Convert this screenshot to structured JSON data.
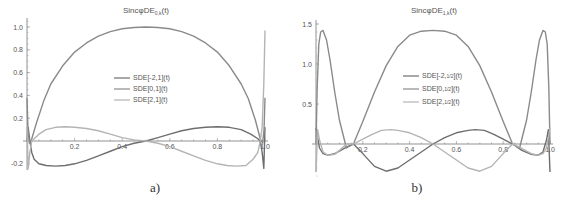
{
  "chart_data": [
    {
      "type": "line",
      "id": "a",
      "title": "SincφDE_{0,k}(t)",
      "title_main": "SincφDE",
      "title_sub": "0,k",
      "title_tail": "(t)",
      "panel_label": "a)",
      "xlabel": "",
      "ylabel": "",
      "xlim": [
        0,
        1.0
      ],
      "ylim": [
        -0.25,
        1.05
      ],
      "xticks": [
        0.2,
        0.4,
        0.6,
        0.8,
        1.0
      ],
      "xtick_labels": [
        "0.2",
        "0.4",
        "0.6",
        "0.8",
        "1.0"
      ],
      "yticks": [
        -0.2,
        0.2,
        0.4,
        0.6,
        0.8,
        1.0
      ],
      "ytick_labels": [
        "-0.2",
        "0.2",
        "0.4",
        "0.6",
        "0.8",
        "1.0"
      ],
      "grid": false,
      "legend_position": "center",
      "series": [
        {
          "name": "SDE[-2,1](t)",
          "color": "#6e6e6e",
          "x": [
            0,
            0.005,
            0.012,
            0.02,
            0.03,
            0.05,
            0.08,
            0.12,
            0.16,
            0.2,
            0.25,
            0.3,
            0.35,
            0.4,
            0.45,
            0.5,
            0.55,
            0.6,
            0.65,
            0.7,
            0.75,
            0.8,
            0.85,
            0.9,
            0.94,
            0.97,
            0.98,
            0.988,
            0.995,
            1.0
          ],
          "y": [
            0.0,
            0.12,
            0.0,
            -0.1,
            -0.16,
            -0.2,
            -0.215,
            -0.22,
            -0.215,
            -0.2,
            -0.17,
            -0.13,
            -0.09,
            -0.05,
            -0.02,
            0.0,
            0.03,
            0.06,
            0.09,
            0.11,
            0.12,
            0.125,
            0.12,
            0.1,
            0.06,
            0.02,
            0.0,
            -0.1,
            -0.24,
            0.12
          ]
        },
        {
          "name": "SDE[0,1](t)",
          "color": "#8a8a8a",
          "x": [
            0,
            0.004,
            0.01,
            0.02,
            0.04,
            0.07,
            0.1,
            0.15,
            0.2,
            0.25,
            0.3,
            0.35,
            0.4,
            0.45,
            0.5,
            0.55,
            0.6,
            0.65,
            0.7,
            0.75,
            0.8,
            0.85,
            0.9,
            0.93,
            0.96,
            0.98,
            0.99,
            0.996,
            1.0
          ],
          "y": [
            0.38,
            0.1,
            -0.02,
            0.02,
            0.16,
            0.35,
            0.5,
            0.66,
            0.78,
            0.86,
            0.92,
            0.96,
            0.985,
            0.995,
            1.0,
            0.995,
            0.985,
            0.96,
            0.92,
            0.86,
            0.78,
            0.66,
            0.5,
            0.37,
            0.18,
            0.02,
            -0.02,
            0.1,
            0.38
          ]
        },
        {
          "name": "SDE[2,1](t)",
          "color": "#b4b4b4",
          "x": [
            0,
            0.005,
            0.012,
            0.02,
            0.03,
            0.05,
            0.08,
            0.12,
            0.16,
            0.2,
            0.25,
            0.3,
            0.35,
            0.4,
            0.45,
            0.5,
            0.55,
            0.6,
            0.65,
            0.7,
            0.75,
            0.8,
            0.84,
            0.88,
            0.92,
            0.95,
            0.97,
            0.98,
            0.988,
            0.995,
            1.0
          ],
          "y": [
            0.12,
            -0.24,
            -0.1,
            0.0,
            0.02,
            0.06,
            0.1,
            0.12,
            0.125,
            0.12,
            0.11,
            0.09,
            0.06,
            0.03,
            0.01,
            0.0,
            -0.02,
            -0.05,
            -0.09,
            -0.13,
            -0.17,
            -0.2,
            -0.215,
            -0.22,
            -0.215,
            -0.16,
            -0.1,
            0.0,
            0.12,
            0.5,
            0.97
          ]
        }
      ]
    },
    {
      "type": "line",
      "id": "b",
      "title": "SincφDE_{1,k}(t)",
      "title_main": "SincφDE",
      "title_sub": "1,k",
      "title_tail": "(t)",
      "panel_label": "b)",
      "xlabel": "",
      "ylabel": "",
      "xlim": [
        0,
        1.0
      ],
      "ylim": [
        -0.4,
        1.5
      ],
      "xticks": [
        0.2,
        0.4,
        0.6,
        0.8,
        1.0
      ],
      "xtick_labels": [
        "0.2",
        "0.4",
        "0.6",
        "0.8",
        "1.0"
      ],
      "yticks": [
        0.5,
        1.0,
        1.5
      ],
      "ytick_labels": [
        "0.5",
        "1.0",
        "1.5"
      ],
      "grid": false,
      "legend_position": "center",
      "series": [
        {
          "name": "SDE[-2,1/2](t)",
          "legend_main": "SDE[-2,",
          "legend_frac": "1/2",
          "legend_tail": "](t)",
          "color": "#6e6e6e",
          "x": [
            0,
            0.006,
            0.015,
            0.03,
            0.05,
            0.08,
            0.1,
            0.13,
            0.16,
            0.2,
            0.25,
            0.3,
            0.35,
            0.4,
            0.45,
            0.5,
            0.55,
            0.6,
            0.65,
            0.68,
            0.72,
            0.76,
            0.8,
            0.84,
            0.88,
            0.92,
            0.95,
            0.97,
            0.985,
            0.993,
            1.0
          ],
          "y": [
            0.2,
            0.1,
            -0.05,
            -0.12,
            -0.14,
            -0.12,
            -0.09,
            -0.04,
            0.0,
            -0.12,
            -0.28,
            -0.34,
            -0.3,
            -0.2,
            -0.1,
            0.0,
            0.08,
            0.14,
            0.17,
            0.18,
            0.17,
            0.12,
            0.06,
            0.0,
            -0.08,
            -0.13,
            -0.14,
            -0.1,
            0.05,
            0.18,
            -0.35
          ]
        },
        {
          "name": "SDE[0,1/2](t)",
          "legend_main": "SDE[0,",
          "legend_frac": "1/2",
          "legend_tail": "](t)",
          "color": "#8a8a8a",
          "x": [
            0,
            0.005,
            0.012,
            0.02,
            0.03,
            0.045,
            0.06,
            0.08,
            0.1,
            0.13,
            0.16,
            0.2,
            0.25,
            0.3,
            0.35,
            0.4,
            0.45,
            0.5,
            0.55,
            0.6,
            0.65,
            0.7,
            0.75,
            0.8,
            0.84,
            0.87,
            0.9,
            0.92,
            0.94,
            0.955,
            0.97,
            0.98,
            0.988,
            0.995,
            1.0
          ],
          "y": [
            0.0,
            0.7,
            1.25,
            1.4,
            1.42,
            1.3,
            1.05,
            0.65,
            0.3,
            -0.05,
            0.0,
            0.28,
            0.65,
            0.98,
            1.22,
            1.36,
            1.41,
            1.42,
            1.41,
            1.36,
            1.22,
            0.98,
            0.65,
            0.28,
            0.0,
            -0.05,
            0.3,
            0.65,
            1.05,
            1.3,
            1.42,
            1.4,
            1.25,
            0.7,
            0.0
          ]
        },
        {
          "name": "SDE[2,1/2](t)",
          "legend_main": "SDE[2,",
          "legend_frac": "1/2",
          "legend_tail": "](t)",
          "color": "#b4b4b4",
          "x": [
            0,
            0.007,
            0.015,
            0.03,
            0.05,
            0.08,
            0.1,
            0.13,
            0.16,
            0.2,
            0.24,
            0.28,
            0.32,
            0.35,
            0.4,
            0.45,
            0.5,
            0.55,
            0.6,
            0.65,
            0.7,
            0.75,
            0.8,
            0.84,
            0.87,
            0.9,
            0.92,
            0.95,
            0.97,
            0.985,
            0.994,
            1.0
          ],
          "y": [
            -0.35,
            0.18,
            0.05,
            -0.1,
            -0.14,
            -0.13,
            -0.08,
            0.0,
            0.0,
            0.06,
            0.12,
            0.17,
            0.18,
            0.17,
            0.14,
            0.08,
            0.0,
            -0.1,
            -0.2,
            -0.3,
            -0.34,
            -0.28,
            -0.12,
            0.0,
            -0.04,
            -0.09,
            -0.12,
            -0.14,
            -0.12,
            -0.05,
            0.1,
            0.2
          ]
        }
      ]
    }
  ]
}
